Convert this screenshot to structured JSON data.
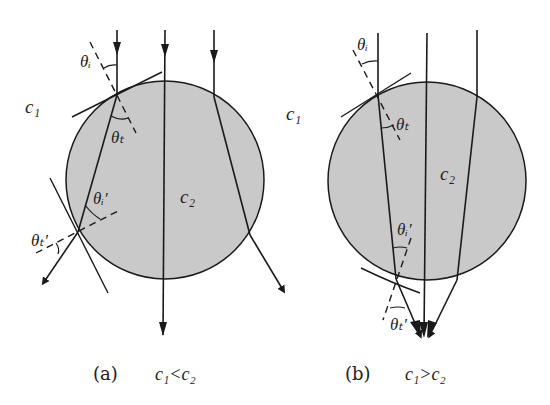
{
  "colors": {
    "background": "#ffffff",
    "medium_fill": "#c9c9c9",
    "stroke": "#1a1a1a"
  },
  "panel_a": {
    "caption_label": "(a)",
    "caption_condition": "c₁<c₂",
    "outer_medium_label": "c₁",
    "inner_medium_label": "c₂",
    "incident_angle_label": "θᵢ",
    "transmitted_angle_label": "θₜ",
    "exit_incident_angle_label": "θᵢ′",
    "exit_transmitted_angle_label": "θₜ′"
  },
  "panel_b": {
    "caption_label": "(b)",
    "caption_condition": "c₁>c₂",
    "outer_medium_label": "c₁",
    "inner_medium_label": "c₂",
    "incident_angle_label": "θᵢ",
    "transmitted_angle_label": "θₜ",
    "exit_incident_angle_label": "θᵢ′",
    "exit_transmitted_angle_label": "θₜ′"
  }
}
